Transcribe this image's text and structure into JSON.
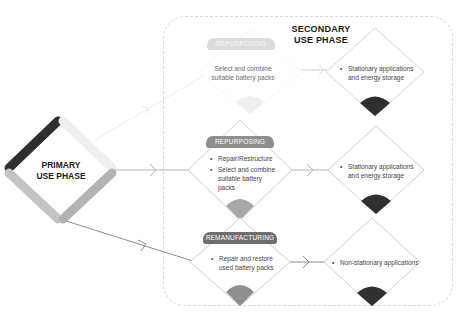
{
  "primary": {
    "title": "PRIMARY\nUSE PHASE",
    "title_line1": "PRIMARY",
    "title_line2": "USE PHASE"
  },
  "secondary": {
    "title_line1": "SECONDARY",
    "title_line2": "USE PHASE"
  },
  "paths": [
    {
      "process_tag": "REPURPOSING",
      "process_items": [
        "Select and combine suitable battery packs"
      ],
      "application_items": [
        "Stationary applications and energy storage"
      ],
      "faded": true
    },
    {
      "process_tag": "REPURPOSING",
      "process_items": [
        "Repair/Restructure",
        "Select and combine suitable battery packs"
      ],
      "application_items": [
        "Stationary applications and energy storage"
      ],
      "faded": false
    },
    {
      "process_tag": "REMANUFACTURING",
      "process_items": [
        "Repair and restore used battery packs"
      ],
      "application_items": [
        "Non-stationary applications"
      ],
      "faded": false
    }
  ],
  "colors": {
    "dark": "#2f2f2f",
    "mid_gray": "#9a9a9a",
    "light_gray": "#c8c8c8",
    "faint": "#eeeeee",
    "line": "#8c8c8c",
    "frame": "#d9d9d9"
  }
}
